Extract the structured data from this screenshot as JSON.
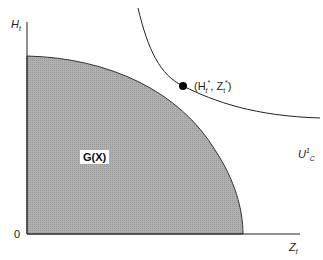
{
  "diagram": {
    "y_axis_label": "H",
    "y_axis_sub": "t",
    "x_axis_label": "Z",
    "x_axis_sub": "t",
    "origin_label": "0",
    "region_label": "G(X)",
    "point_label": "(H",
    "point_label_sub1": "t",
    "point_label_sup1": "*",
    "point_label_mid": ", Z",
    "point_label_sub2": "t",
    "point_label_sup2": "*",
    "point_label_end": ")",
    "curve_label": "U",
    "curve_label_sup": "1",
    "curve_label_sub": "C",
    "colors": {
      "region_fill": "#a9a9a9",
      "line": "#222222",
      "point": "#000000"
    }
  }
}
